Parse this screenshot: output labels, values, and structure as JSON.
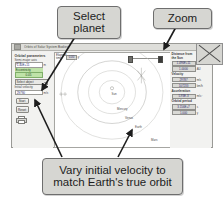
{
  "window": {
    "title": "Orbits of Solar System Bodies",
    "title_icon": "app-icon",
    "close_icon": "close-x-icon"
  },
  "left_panel": {
    "section_title": "Orbital parameters",
    "semi_major_axis": {
      "label": "Semi-major axis",
      "value": "1.40E+11",
      "unit": "m"
    },
    "eccentricity": {
      "label": "Eccentricity",
      "value": "0.05"
    },
    "select_object": {
      "label": "Select object",
      "selected": "Select object",
      "options": [
        "Select object",
        "Mercury",
        "Venus",
        "Earth",
        "Mars"
      ],
      "icon": "chevron-down-icon"
    },
    "initial_velocity": {
      "label": "Initial velocity",
      "value": "29790",
      "unit": "m/s"
    },
    "start_button": "Start",
    "reset_button": "Reset",
    "print": {
      "label": "print",
      "icon": "printer-icon"
    }
  },
  "canvas": {
    "elapsed": {
      "label": "Elapsed time",
      "value": "0.00",
      "unit": "y"
    },
    "zoom_control": {
      "label": "Zoom",
      "icon": "slider-icon",
      "handle_left": "zoom-out-handle",
      "handle_right": "zoom-in-handle"
    },
    "sun_label": "Sun",
    "orbits": [
      {
        "name": "Mercury",
        "radius_pct": 16
      },
      {
        "name": "Venus",
        "radius_pct": 28
      },
      {
        "name": "Earth",
        "radius_pct": 40
      },
      {
        "name": "Mars",
        "radius_pct": 58
      }
    ]
  },
  "right_panel": {
    "distance": {
      "title_line1": "Distance from",
      "title_line2": "the Sun",
      "value_m": "1.496E+11",
      "unit_m": "m",
      "value_au": "1.0000",
      "unit_au": "AU"
    },
    "velocity": {
      "title": "Velocity",
      "value_ms": "29787",
      "unit_ms": "m/s",
      "value_kmh": "107233",
      "unit_kmh": "km/h"
    },
    "acceleration": {
      "title": "Acceleration",
      "value": "5.93E-3",
      "unit": "m/s²"
    },
    "orbital_period": {
      "title": "Orbital period",
      "value_s": "3.156E+7",
      "unit_s": "s",
      "value_y": "1.000",
      "unit_y": "y"
    }
  },
  "annotations": {
    "select_planet_line1": "Select",
    "select_planet_line2": "planet",
    "zoom": "Zoom",
    "vary_line1": "Vary initial velocity to",
    "vary_line2": "match Earth's true orbit"
  }
}
